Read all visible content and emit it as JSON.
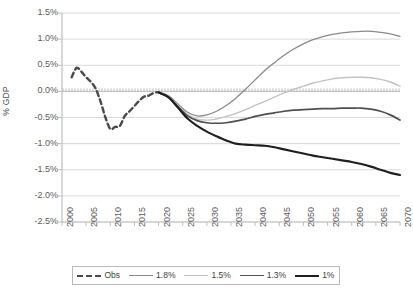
{
  "chart_data": {
    "type": "line",
    "title": "",
    "xlabel": "",
    "ylabel": "% GDP",
    "xlim": [
      2000,
      2070
    ],
    "ylim": [
      -2.5,
      1.5
    ],
    "grid": true,
    "legend_position": "bottom",
    "ytick_labels": [
      "1.5%",
      "1.0%",
      "0.5%",
      "0.0%",
      "-0.5%",
      "-1.0%",
      "-1.5%",
      "-2.0%",
      "-2.5%"
    ],
    "ytick_values": [
      1.5,
      1.0,
      0.5,
      0.0,
      -0.5,
      -1.0,
      -1.5,
      -2.0,
      -2.5
    ],
    "xtick_labels": [
      "2000",
      "2005",
      "2010",
      "2015",
      "2020",
      "2025",
      "2030",
      "2035",
      "2040",
      "2045",
      "2050",
      "2055",
      "2060",
      "2065",
      "2070"
    ],
    "xtick_values": [
      2000,
      2005,
      2010,
      2015,
      2020,
      2025,
      2030,
      2035,
      2040,
      2045,
      2050,
      2055,
      2060,
      2065,
      2070
    ],
    "series": [
      {
        "name": "Obs",
        "color": "#4a4a4a",
        "width": 2.4,
        "dash": "5,3.5",
        "x": [
          2002,
          2003,
          2004,
          2005,
          2006,
          2007,
          2008,
          2009,
          2010,
          2011,
          2012,
          2013,
          2014,
          2015,
          2016,
          2017,
          2018,
          2019,
          2020,
          2021
        ],
        "values": [
          0.27,
          0.45,
          0.38,
          0.27,
          0.18,
          0.05,
          -0.2,
          -0.5,
          -0.72,
          -0.68,
          -0.66,
          -0.47,
          -0.38,
          -0.28,
          -0.18,
          -0.1,
          -0.08,
          -0.03,
          -0.02,
          -0.06
        ]
      },
      {
        "name": "1.8%",
        "color": "#8a8a8a",
        "width": 1.3,
        "dash": "",
        "x": [
          2020,
          2022,
          2024,
          2026,
          2028,
          2030,
          2032,
          2034,
          2036,
          2038,
          2040,
          2042,
          2044,
          2046,
          2048,
          2050,
          2052,
          2054,
          2056,
          2058,
          2060,
          2062,
          2064,
          2066,
          2068,
          2070
        ],
        "values": [
          -0.02,
          -0.08,
          -0.24,
          -0.4,
          -0.47,
          -0.45,
          -0.38,
          -0.27,
          -0.13,
          0.04,
          0.22,
          0.4,
          0.55,
          0.69,
          0.81,
          0.91,
          0.99,
          1.05,
          1.09,
          1.12,
          1.14,
          1.15,
          1.15,
          1.13,
          1.1,
          1.05
        ]
      },
      {
        "name": "1.5%",
        "color": "#c2c2c2",
        "width": 1.4,
        "dash": "",
        "x": [
          2020,
          2022,
          2024,
          2026,
          2028,
          2030,
          2032,
          2034,
          2036,
          2038,
          2040,
          2042,
          2044,
          2046,
          2048,
          2050,
          2052,
          2054,
          2056,
          2058,
          2060,
          2062,
          2064,
          2066,
          2068,
          2070
        ],
        "values": [
          -0.02,
          -0.09,
          -0.27,
          -0.44,
          -0.53,
          -0.55,
          -0.53,
          -0.48,
          -0.42,
          -0.35,
          -0.27,
          -0.19,
          -0.11,
          -0.03,
          0.04,
          0.1,
          0.16,
          0.2,
          0.24,
          0.26,
          0.27,
          0.27,
          0.26,
          0.23,
          0.18,
          0.1
        ]
      },
      {
        "name": "1.3%",
        "color": "#4f4f4f",
        "width": 1.7,
        "dash": "",
        "x": [
          2020,
          2022,
          2024,
          2026,
          2028,
          2030,
          2032,
          2034,
          2036,
          2038,
          2040,
          2042,
          2044,
          2046,
          2048,
          2050,
          2052,
          2054,
          2056,
          2058,
          2060,
          2062,
          2064,
          2066,
          2068,
          2070
        ],
        "values": [
          -0.02,
          -0.1,
          -0.29,
          -0.47,
          -0.56,
          -0.6,
          -0.61,
          -0.6,
          -0.57,
          -0.53,
          -0.48,
          -0.44,
          -0.41,
          -0.38,
          -0.36,
          -0.35,
          -0.34,
          -0.33,
          -0.33,
          -0.32,
          -0.32,
          -0.32,
          -0.34,
          -0.38,
          -0.45,
          -0.55
        ]
      },
      {
        "name": "1%",
        "color": "#1f1f1f",
        "width": 2.1,
        "dash": "",
        "x": [
          2020,
          2022,
          2024,
          2026,
          2028,
          2030,
          2032,
          2034,
          2036,
          2038,
          2040,
          2042,
          2044,
          2046,
          2048,
          2050,
          2052,
          2054,
          2056,
          2058,
          2060,
          2062,
          2064,
          2066,
          2068,
          2070
        ],
        "values": [
          -0.02,
          -0.11,
          -0.31,
          -0.52,
          -0.66,
          -0.77,
          -0.86,
          -0.94,
          -1.0,
          -1.02,
          -1.03,
          -1.04,
          -1.07,
          -1.11,
          -1.15,
          -1.19,
          -1.23,
          -1.26,
          -1.29,
          -1.32,
          -1.35,
          -1.39,
          -1.44,
          -1.5,
          -1.56,
          -1.6
        ]
      }
    ]
  },
  "legend": {
    "items": [
      {
        "label": "Obs",
        "color": "#4a4a4a",
        "dash": "dashed",
        "width": 2.4
      },
      {
        "label": "1.8%",
        "color": "#8a8a8a",
        "dash": "solid",
        "width": 1.3
      },
      {
        "label": "1.5%",
        "color": "#c2c2c2",
        "dash": "solid",
        "width": 1.4
      },
      {
        "label": "1.3%",
        "color": "#4f4f4f",
        "dash": "solid",
        "width": 1.7
      },
      {
        "label": "1%",
        "color": "#1f1f1f",
        "dash": "solid",
        "width": 2.1
      }
    ]
  },
  "plot_geometry": {
    "left": 62,
    "right": 400,
    "top": 13,
    "bottom": 222
  },
  "colors": {
    "grid": "#d9d9d9",
    "axis": "#bfbfbf",
    "text": "#5a5a5a",
    "zero_axis": "#bdbdbd"
  }
}
